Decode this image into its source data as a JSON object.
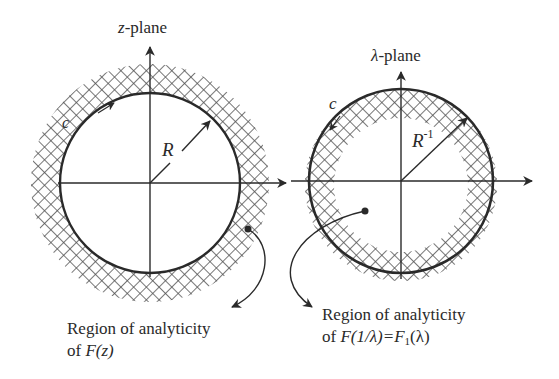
{
  "left_plane": {
    "title_var": "z",
    "title_suffix": "-plane",
    "radius_label": "R",
    "contour_label": "c",
    "caption_line1": "Region of analyticity",
    "caption_line2_prefix": "of ",
    "caption_line2_func": "F(z)"
  },
  "right_plane": {
    "title_var": "λ",
    "title_suffix": "-plane",
    "radius_label": "R",
    "radius_exponent": "-1",
    "contour_label": "c",
    "caption_line1": "Region of analyticity",
    "caption_line2_prefix": "of ",
    "caption_line2_func": "F(1/λ)=F",
    "caption_line2_sub": "1",
    "caption_line2_tail": "(λ)"
  },
  "colors": {
    "line": "#2a2a2a",
    "hatch": "#555555"
  }
}
